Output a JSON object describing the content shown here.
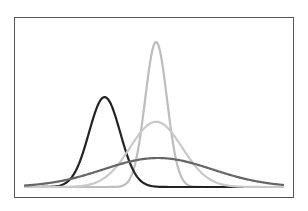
{
  "chart_data": {
    "type": "line",
    "title": "",
    "xlabel": "",
    "ylabel": "",
    "grid": false,
    "legend": null,
    "axis_ticks": "none",
    "xlim": [
      -5,
      5
    ],
    "ylim": [
      0,
      1.05
    ],
    "series": [
      {
        "name": "narrow-tall",
        "mean": 0.08,
        "sd": 0.42,
        "peak": 1.0,
        "color": "#bdbdbd"
      },
      {
        "name": "left-shifted",
        "mean": -1.9,
        "sd": 0.6,
        "peak": 0.62,
        "color": "#222222"
      },
      {
        "name": "medium",
        "mean": 0.08,
        "sd": 1.0,
        "peak": 0.45,
        "color": "#c9c9c9"
      },
      {
        "name": "wide-flat",
        "mean": 0.15,
        "sd": 2.1,
        "peak": 0.2,
        "color": "#666666"
      }
    ]
  },
  "layout": {
    "frame_color": "#555555",
    "background": "#ffffff",
    "line_width": 2.2
  }
}
